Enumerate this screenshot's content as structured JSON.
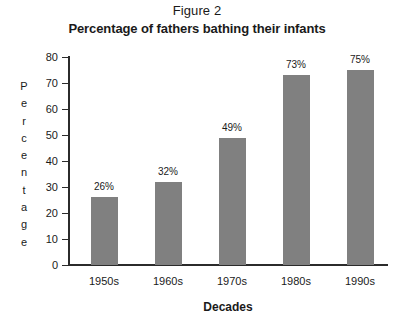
{
  "figure": {
    "label": "Figure 2",
    "title": "Percentage of fathers bathing their infants"
  },
  "chart_data": {
    "type": "bar",
    "title": "Percentage of fathers bathing their infants",
    "subtitle": "Figure 2",
    "xlabel": "Decades",
    "ylabel": "Percentage",
    "categories": [
      "1950s",
      "1960s",
      "1970s",
      "1980s",
      "1990s"
    ],
    "values": [
      26,
      32,
      49,
      73,
      75
    ],
    "value_labels": [
      "26%",
      "32%",
      "49%",
      "73%",
      "75%"
    ],
    "ylim": [
      0,
      80
    ],
    "yticks": [
      0,
      10,
      20,
      30,
      40,
      50,
      60,
      70,
      80
    ],
    "ytick_labels": [
      "0",
      "10",
      "20",
      "30",
      "40",
      "50",
      "60",
      "70",
      "80"
    ],
    "grid": false,
    "legend": false,
    "bar_color": "#808080",
    "axis_color": "#2b2b2b",
    "background": "#ffffff",
    "ylabel_letters": [
      "P",
      "e",
      "r",
      "c",
      "e",
      "n",
      "t",
      "a",
      "g",
      "e"
    ]
  }
}
